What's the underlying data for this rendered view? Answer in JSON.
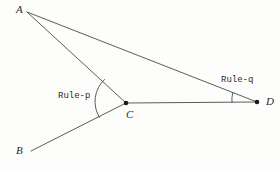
{
  "figure": {
    "type": "geometry-diagram",
    "background_color": "#fdfdfc",
    "stroke_color": "#4a4a4a",
    "label_color": "#2b2b2b",
    "width": 280,
    "height": 171
  },
  "points": {
    "a": {
      "label": "A",
      "x": 27,
      "y": 12,
      "label_x": 16,
      "label_y": 4,
      "dot": false
    },
    "b": {
      "label": "B",
      "x": 31,
      "y": 151,
      "label_x": 16,
      "label_y": 146,
      "dot": false
    },
    "c": {
      "label": "C",
      "x": 126,
      "y": 103,
      "label_x": 126,
      "label_y": 109,
      "dot": true
    },
    "d": {
      "label": "D",
      "x": 257,
      "y": 102,
      "label_x": 266,
      "label_y": 96,
      "dot": true
    }
  },
  "segments": [
    {
      "name": "segment-a-c",
      "from": "A",
      "to": "C"
    },
    {
      "name": "segment-a-d",
      "from": "A",
      "to": "D"
    },
    {
      "name": "segment-c-d",
      "from": "C",
      "to": "D"
    },
    {
      "name": "segment-c-b",
      "from": "C",
      "to": "B"
    }
  ],
  "angle_marks": [
    {
      "name": "angle-arc-at-c",
      "vertex": "C",
      "between": [
        "A",
        "B"
      ],
      "label": "Rule-p",
      "label_x": 58,
      "label_y": 92
    },
    {
      "name": "angle-arc-at-d",
      "vertex": "D",
      "between": [
        "A",
        "C"
      ],
      "label": "Rule-q",
      "label_x": 221,
      "label_y": 76
    }
  ],
  "labels": {
    "rule_p": "Rule-p",
    "rule_q": "Rule-q",
    "point_a": "A",
    "point_b": "B",
    "point_c": "C",
    "point_d": "D"
  }
}
